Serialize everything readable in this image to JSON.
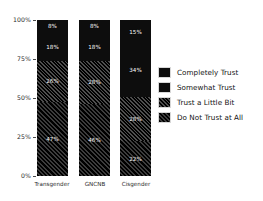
{
  "chart_data": {
    "type": "bar",
    "subtype": "stacked-percentage",
    "title": "",
    "xlabel": "",
    "ylabel": "",
    "ylim": [
      0,
      100
    ],
    "grid": false,
    "legend_position": "right",
    "categories": [
      "Transgender",
      "GNCNB",
      "Cisgender"
    ],
    "ytick_labels": [
      "100%",
      "75%",
      "50%",
      "25%",
      "0%"
    ],
    "ytick_values": [
      100,
      75,
      50,
      25,
      0
    ],
    "series": [
      {
        "name": "Completely Trust",
        "fill": "solid",
        "values": [
          8,
          8,
          15
        ],
        "labels": [
          "8%",
          "8%",
          "15%"
        ]
      },
      {
        "name": "Somewhat Trust",
        "fill": "solid",
        "values": [
          18,
          18,
          34
        ],
        "labels": [
          "18%",
          "18%",
          "34%"
        ]
      },
      {
        "name": "Trust a Little Bit",
        "fill": "hatch-a",
        "values": [
          26,
          28,
          28
        ],
        "labels": [
          "26%",
          "28%",
          "28%"
        ]
      },
      {
        "name": "Do Not Trust at All",
        "fill": "hatch-b",
        "values": [
          47,
          46,
          22
        ],
        "labels": [
          "47%",
          "46%",
          "22%"
        ]
      }
    ]
  },
  "legend": {
    "items": [
      {
        "label": "Completely Trust"
      },
      {
        "label": "Somewhat Trust"
      },
      {
        "label": "Trust a Little Bit"
      },
      {
        "label": "Do Not Trust at All"
      }
    ]
  },
  "colors": {
    "bar_solid": "#0d0d0d",
    "hatch_dark": "#000000",
    "hatch_light": "#4e4e4e",
    "label_text": "#ffffff",
    "axis_text": "#2a2a2a",
    "background": "#ffffff"
  }
}
